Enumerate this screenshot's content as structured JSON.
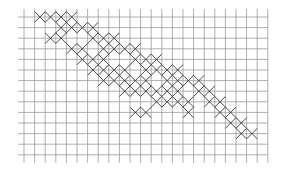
{
  "diagram": {
    "type": "cross-stitch-grid",
    "grid": {
      "cols": 23,
      "rows": 14,
      "origin_x": 14,
      "origin_y": 17,
      "cell_w": 10.6,
      "cell_h": 10.6,
      "line_color": "#9a9a9a",
      "mark_color": "#333333"
    },
    "crosses": [
      [
        1,
        0
      ],
      [
        2,
        0
      ],
      [
        3,
        0
      ],
      [
        4,
        0
      ],
      [
        3,
        1
      ],
      [
        4,
        1
      ],
      [
        5,
        1
      ],
      [
        6,
        1
      ],
      [
        2,
        2
      ],
      [
        3,
        2
      ],
      [
        6,
        2
      ],
      [
        7,
        2
      ],
      [
        8,
        2
      ],
      [
        4,
        3
      ],
      [
        5,
        3
      ],
      [
        7,
        3
      ],
      [
        8,
        3
      ],
      [
        9,
        3
      ],
      [
        10,
        3
      ],
      [
        5,
        4
      ],
      [
        6,
        4
      ],
      [
        7,
        4
      ],
      [
        10,
        4
      ],
      [
        11,
        4
      ],
      [
        12,
        4
      ],
      [
        6,
        5
      ],
      [
        7,
        5
      ],
      [
        8,
        5
      ],
      [
        9,
        5
      ],
      [
        11,
        5
      ],
      [
        12,
        5
      ],
      [
        13,
        5
      ],
      [
        14,
        5
      ],
      [
        7,
        6
      ],
      [
        8,
        6
      ],
      [
        9,
        6
      ],
      [
        10,
        6
      ],
      [
        11,
        6
      ],
      [
        13,
        6
      ],
      [
        14,
        6
      ],
      [
        15,
        6
      ],
      [
        16,
        6
      ],
      [
        9,
        7
      ],
      [
        10,
        7
      ],
      [
        11,
        7
      ],
      [
        12,
        7
      ],
      [
        13,
        7
      ],
      [
        14,
        7
      ],
      [
        16,
        7
      ],
      [
        17,
        7
      ],
      [
        12,
        8
      ],
      [
        13,
        8
      ],
      [
        14,
        8
      ],
      [
        15,
        8
      ],
      [
        17,
        8
      ],
      [
        18,
        8
      ],
      [
        10,
        9
      ],
      [
        11,
        9
      ],
      [
        15,
        9
      ],
      [
        18,
        9
      ],
      [
        19,
        9
      ],
      [
        19,
        10
      ],
      [
        20,
        10
      ],
      [
        20,
        11
      ],
      [
        21,
        11
      ]
    ]
  }
}
